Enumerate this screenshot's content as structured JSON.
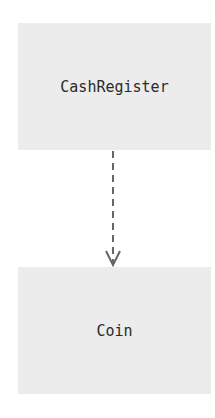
{
  "diagram": {
    "nodes": [
      {
        "id": "cashregister",
        "label": "CashRegister"
      },
      {
        "id": "coin",
        "label": "Coin"
      }
    ],
    "edges": [
      {
        "from": "cashregister",
        "to": "coin",
        "style": "dashed",
        "arrow": "open",
        "color": "#666666"
      }
    ],
    "colors": {
      "node_fill": "#ececec",
      "text": "#2a2a2a",
      "edge": "#666666",
      "background": "#ffffff"
    }
  }
}
